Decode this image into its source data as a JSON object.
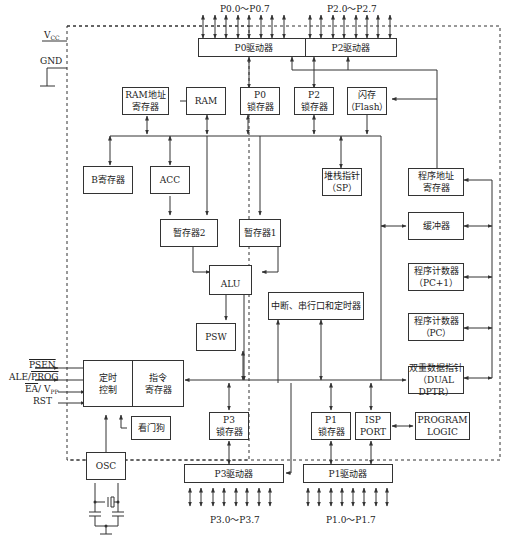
{
  "diagram": {
    "title": "",
    "ports_top": {
      "p0": "P0.0～P0.7",
      "p2": "P2.0～P2.7"
    },
    "ports_bottom": {
      "p3": "P3.0～P3.7",
      "p1": "P1.0～P1.7"
    },
    "power": {
      "vcc": "V",
      "vcc_sub": "CC",
      "gnd": "GND"
    },
    "control_pins": {
      "psen": "PSEN",
      "ale": "ALE/",
      "prog": "PROG",
      "ea": "EA",
      "vpp": "/ V",
      "vpp_sub": "PP",
      "rst": "RST"
    },
    "blocks": {
      "p0_driver": "P0驱动器",
      "p2_driver": "P2驱动器",
      "ram_addr_line1": "RAM地址",
      "ram_addr_line2": "寄存器",
      "ram": "RAM",
      "p0_latch_line1": "P0",
      "p0_latch_line2": "锁存器",
      "p2_latch_line1": "P2",
      "p2_latch_line2": "锁存器",
      "flash_line1": "闪存",
      "flash_line2": "（Flash）",
      "b_reg": "B寄存器",
      "acc": "ACC",
      "sp_line1": "堆栈指针",
      "sp_line2": "（SP）",
      "prog_addr_line1": "程序地址",
      "prog_addr_line2": "寄存器",
      "tmp2": "暂存器2",
      "tmp1": "暂存器1",
      "buffer": "缓冲器",
      "alu": "ALU",
      "pc1_line1": "程序计数器",
      "pc1_line2": "（PC+1）",
      "interrupt": "中断、串行口和定时器",
      "pc_line1": "程序计数器",
      "pc_line2": "（PC）",
      "psw": "PSW",
      "timing_line1": "定时",
      "timing_line2": "控制",
      "ir_line1": "指令",
      "ir_line2": "寄存器",
      "dptr_line1": "双重数据指针",
      "dptr_line2": "（DUAL DPTR）",
      "watchdog": "看门狗",
      "p3_latch_line1": "P3",
      "p3_latch_line2": "锁存器",
      "p1_latch_line1": "P1",
      "p1_latch_line2": "锁存器",
      "isp_line1": "ISP",
      "isp_line2": "PORT",
      "prog_logic_line1": "PROGRAM",
      "prog_logic_line2": "LOGIC",
      "osc": "OSC",
      "p3_driver": "P3驱动器",
      "p1_driver": "P1驱动器"
    }
  }
}
